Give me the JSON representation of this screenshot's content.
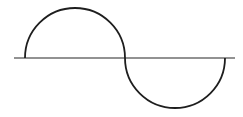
{
  "diagram": {
    "title": "",
    "colors": {
      "background": "#ffffff",
      "axis": "#6e6e6e",
      "curve": "#1e1e1e"
    },
    "axis": {
      "x1": 14,
      "x2": 235,
      "y": 58
    },
    "curve": {
      "start_x": 25,
      "mid_x": 125,
      "end_x": 225,
      "baseline_y": 58,
      "radius": 50
    }
  }
}
